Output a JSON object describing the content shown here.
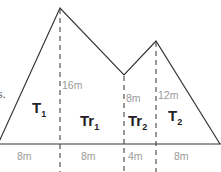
{
  "diagram": {
    "type": "composite-area-figure",
    "left_fragment_text": "s.",
    "regions": [
      {
        "name": "T",
        "subscript": "1",
        "shape": "triangle"
      },
      {
        "name": "Tr",
        "subscript": "1",
        "shape": "trapezoid"
      },
      {
        "name": "Tr",
        "subscript": "2",
        "shape": "trapezoid"
      },
      {
        "name": "T",
        "subscript": "2",
        "shape": "triangle"
      }
    ],
    "heights": [
      "16m",
      "8m",
      "12m"
    ],
    "base_segments": [
      "8m",
      "8m",
      "4m",
      "8m"
    ],
    "colors": {
      "outline": "#333333",
      "dashed": "#444444",
      "dimension_text": "#9a9a9a",
      "region_text": "#222222"
    }
  }
}
